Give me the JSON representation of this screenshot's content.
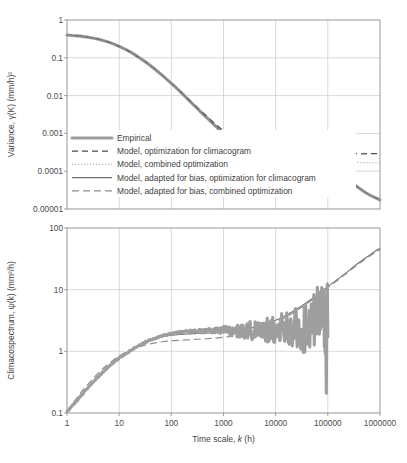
{
  "figure": {
    "xlabel": "Time scale, k (h)",
    "xlabel_italic": "k",
    "x_ticks": [
      "1",
      "10",
      "100",
      "1000",
      "10000",
      "100000",
      "1000000"
    ],
    "x_range": [
      0,
      6
    ],
    "grid": true
  },
  "legend": {
    "position": "inside-top-panel-lower-left",
    "items": [
      {
        "label": "Empirical",
        "style": "thick-solid-gray",
        "color": "#9e9e9e"
      },
      {
        "label": "Model, optimization for climacogram",
        "style": "dashed-dark",
        "color": "#4a4a4a"
      },
      {
        "label": "Model, combined optimization",
        "style": "dotted-light",
        "color": "#b4b4b4"
      },
      {
        "label": "Model, adapted for bias, optimization for climacogram",
        "style": "thin-solid",
        "color": "#6e6e6e"
      },
      {
        "label": "Model, adapted for bias, combined optimization",
        "style": "dashed-gray",
        "color": "#8e8e8e"
      }
    ]
  },
  "chart_data": [
    {
      "id": "climacogram",
      "type": "line",
      "title": "",
      "xlabel": "Time scale, k (h)",
      "ylabel": "Variance, γ(K) (mm/h)²",
      "xscale": "log",
      "yscale": "log",
      "xlim": [
        1,
        1000000
      ],
      "ylim": [
        1e-05,
        1
      ],
      "y_ticks": [
        "1",
        "0.1",
        "0.01",
        "0.001",
        "0.0001",
        "0.00001"
      ],
      "y_tick_values": [
        1,
        0.1,
        0.01,
        0.001,
        0.0001,
        1e-05
      ],
      "x_ticks": [
        "1",
        "10",
        "100",
        "1000",
        "10000",
        "100000",
        "1000000"
      ],
      "grid": true,
      "series": [
        {
          "name": "Empirical",
          "style": "thick-solid-gray",
          "x": [
            1,
            1.6,
            2.5,
            4,
            6.3,
            10,
            16,
            25,
            40,
            63,
            100,
            160,
            250,
            400,
            630,
            1000,
            1600,
            2500,
            4000,
            6300,
            10000,
            16000,
            25000,
            40000,
            63000,
            100000,
            160000,
            250000,
            400000,
            630000,
            1000000
          ],
          "y": [
            0.4,
            0.38,
            0.35,
            0.31,
            0.26,
            0.2,
            0.145,
            0.098,
            0.062,
            0.037,
            0.021,
            0.0115,
            0.0062,
            0.0033,
            0.0018,
            0.00098,
            0.00057,
            0.00035,
            0.00023,
            0.000165,
            0.000128,
            0.000113,
            0.000107,
            0.000104,
            0.000102,
            0.0001,
            8e-05,
            5.55e-05,
            3.55e-05,
            2.35e-05,
            1.75e-05
          ]
        },
        {
          "name": "Model, optimization for climacogram",
          "style": "dashed-dark",
          "x": [
            1,
            1.6,
            2.5,
            4,
            6.3,
            10,
            16,
            25,
            40,
            63,
            100,
            160,
            250,
            400,
            630,
            1000,
            1600,
            2500,
            4000,
            6300,
            10000,
            16000,
            25000,
            40000,
            63000,
            100000,
            160000,
            250000,
            400000,
            630000,
            1000000
          ],
          "y": [
            0.4,
            0.38,
            0.35,
            0.31,
            0.26,
            0.2,
            0.145,
            0.098,
            0.062,
            0.037,
            0.021,
            0.0116,
            0.0064,
            0.0035,
            0.002,
            0.00118,
            0.00078,
            0.00058,
            0.00047,
            0.00041,
            0.00038,
            0.00036,
            0.00034,
            0.00033,
            0.00032,
            0.00031,
            0.0003,
            0.0003,
            0.00029,
            0.00029,
            0.00029
          ]
        },
        {
          "name": "Model, combined optimization",
          "style": "dotted-light",
          "x": [
            1,
            1.6,
            2.5,
            4,
            6.3,
            10,
            16,
            25,
            40,
            63,
            100,
            160,
            250,
            400,
            630,
            1000,
            1600,
            2500,
            4000,
            6300,
            10000,
            16000,
            25000,
            40000,
            63000,
            100000,
            160000,
            250000,
            400000,
            630000,
            1000000
          ],
          "y": [
            0.4,
            0.38,
            0.35,
            0.31,
            0.26,
            0.2,
            0.145,
            0.098,
            0.062,
            0.037,
            0.021,
            0.0115,
            0.0063,
            0.0034,
            0.00185,
            0.00104,
            0.00063,
            0.00043,
            0.00032,
            0.00027,
            0.00024,
            0.00022,
            0.000205,
            0.000195,
            0.000188,
            0.000182,
            0.000177,
            0.000173,
            0.00017,
            0.000168,
            0.000167
          ]
        },
        {
          "name": "Model, adapted for bias, optimization for climacogram",
          "style": "thin-solid",
          "x": [
            1,
            1.6,
            2.5,
            4,
            6.3,
            10,
            16,
            25,
            40,
            63,
            100,
            160,
            250,
            400,
            630,
            1000,
            1600,
            2500,
            4000,
            6300,
            10000,
            16000,
            25000,
            40000,
            63000,
            100000,
            160000,
            250000,
            400000,
            630000,
            1000000
          ],
          "y": [
            0.4,
            0.38,
            0.35,
            0.31,
            0.26,
            0.2,
            0.145,
            0.098,
            0.062,
            0.037,
            0.021,
            0.0115,
            0.0062,
            0.0033,
            0.0018,
            0.00098,
            0.00057,
            0.00035,
            0.00023,
            0.000167,
            0.00013,
            0.000115,
            0.000108,
            0.000104,
            0.000102,
            0.0001,
            8e-05,
            5.55e-05,
            3.55e-05,
            2.35e-05,
            1.75e-05
          ]
        },
        {
          "name": "Model, adapted for bias, combined optimization",
          "style": "dashed-gray",
          "x": [
            1,
            1.6,
            2.5,
            4,
            6.3,
            10,
            16,
            25,
            40,
            63,
            100,
            160,
            250,
            400,
            630,
            1000,
            1600,
            2500,
            4000,
            6300,
            10000,
            16000,
            25000,
            40000,
            63000,
            100000,
            160000,
            250000,
            400000,
            630000,
            1000000
          ],
          "y": [
            0.4,
            0.378,
            0.348,
            0.307,
            0.257,
            0.198,
            0.143,
            0.0965,
            0.061,
            0.0365,
            0.0207,
            0.0113,
            0.00612,
            0.00326,
            0.00178,
            0.00097,
            0.000565,
            0.000347,
            0.000228,
            0.000164,
            0.000127,
            0.000113,
            0.000106,
            0.000103,
            0.000101,
            9.95e-05,
            7.95e-05,
            5.52e-05,
            3.53e-05,
            2.34e-05,
            1.74e-05
          ]
        }
      ]
    },
    {
      "id": "climacospectrum",
      "type": "line",
      "title": "",
      "xlabel": "Time scale, k (h)",
      "ylabel": "Climacospectrum, ψ(k) (mm²/h)",
      "xscale": "log",
      "yscale": "log",
      "xlim": [
        1,
        1000000
      ],
      "ylim": [
        0.1,
        100
      ],
      "y_ticks": [
        "100",
        "10",
        "1",
        "0.1"
      ],
      "y_tick_values": [
        100,
        10,
        1,
        0.1
      ],
      "x_ticks": [
        "1",
        "10",
        "100",
        "1000",
        "10000",
        "100000",
        "1000000"
      ],
      "grid": true,
      "series": [
        {
          "name": "Empirical",
          "style": "thick-solid-gray",
          "noisy": true,
          "x": [
            1,
            1.5,
            2.2,
            3.2,
            4.6,
            6.8,
            10,
            15,
            22,
            32,
            46,
            68,
            100,
            150,
            220,
            320,
            460,
            680,
            1000,
            1500,
            2200,
            3200,
            4600,
            6800,
            10000,
            15000,
            22000,
            32000,
            46000,
            68000,
            85000,
            95000,
            100000
          ],
          "y": [
            0.105,
            0.155,
            0.225,
            0.32,
            0.44,
            0.6,
            0.78,
            0.98,
            1.2,
            1.42,
            1.62,
            1.8,
            1.95,
            2.05,
            2.12,
            2.15,
            2.12,
            2.2,
            2.18,
            2.1,
            2.15,
            2.2,
            2.1,
            2.25,
            2.4,
            2.1,
            2.6,
            1.9,
            3.1,
            4.2,
            3.6,
            4.4,
            3.9
          ]
        },
        {
          "name": "Model, optimization for climacogram",
          "style": "thin-solid",
          "x": [
            1,
            1.5,
            2.2,
            3.2,
            4.6,
            6.8,
            10,
            15,
            22,
            32,
            46,
            68,
            100,
            150,
            220,
            320,
            460,
            680,
            1000,
            1500,
            2200,
            3200,
            4600,
            6800,
            10000,
            15000,
            22000,
            32000,
            46000,
            68000,
            100000,
            150000,
            220000,
            320000,
            460000,
            680000,
            1000000
          ],
          "y": [
            0.105,
            0.155,
            0.225,
            0.32,
            0.44,
            0.6,
            0.79,
            0.99,
            1.2,
            1.4,
            1.58,
            1.72,
            1.82,
            1.88,
            1.92,
            1.95,
            1.97,
            2.0,
            2.04,
            2.1,
            2.2,
            2.35,
            2.55,
            2.85,
            3.2,
            3.75,
            4.5,
            5.5,
            6.8,
            8.6,
            11.2,
            14.5,
            18.5,
            24,
            30,
            38,
            47
          ]
        },
        {
          "name": "Model, adapted for bias, combined optimization",
          "style": "dashed-gray",
          "x": [
            1,
            1.5,
            2.2,
            3.2,
            4.6,
            6.8,
            10,
            15,
            22,
            32,
            46,
            68,
            100,
            150,
            220,
            320,
            460,
            680,
            1000,
            1500,
            2200,
            3200,
            4600,
            6800,
            10000,
            15000,
            22000,
            32000,
            46000,
            68000,
            100000,
            150000,
            220000,
            320000,
            460000,
            680000,
            1000000
          ],
          "y": [
            0.105,
            0.17,
            0.255,
            0.365,
            0.5,
            0.66,
            0.84,
            1.0,
            1.15,
            1.27,
            1.36,
            1.43,
            1.48,
            1.51,
            1.54,
            1.57,
            1.6,
            1.64,
            1.69,
            1.77,
            1.88,
            2.03,
            2.24,
            2.55,
            2.95,
            3.5,
            4.25,
            5.25,
            6.5,
            8.3,
            10.8,
            14.0,
            18.0,
            23.2,
            29,
            36.5,
            45
          ]
        }
      ]
    }
  ]
}
